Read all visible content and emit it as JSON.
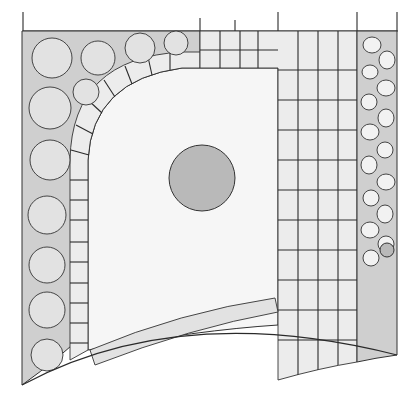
{
  "drawing": {
    "title": "",
    "type": "hand-drawn garden plan (top view)",
    "elements": [
      {
        "name": "left-planting-bed",
        "kind": "shrub border"
      },
      {
        "name": "curved-stepping-path",
        "kind": "paving arc"
      },
      {
        "name": "lawn",
        "kind": "open lawn"
      },
      {
        "name": "central-tree",
        "kind": "specimen tree"
      },
      {
        "name": "paved-terrace",
        "kind": "rectangular paving"
      },
      {
        "name": "right-rock-bed",
        "kind": "pebble / rock border"
      },
      {
        "name": "bottom-hedge",
        "kind": "low hedge strip"
      }
    ],
    "colors": {
      "ink": "#2a2a2a",
      "bed": "#cfcfcf",
      "paving": "#ececec",
      "lawn": "#f6f6f6"
    }
  }
}
